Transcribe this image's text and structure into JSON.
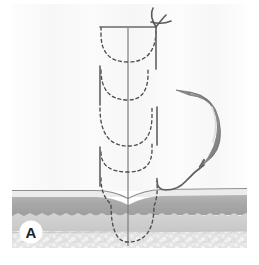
{
  "figure": {
    "panel_label": "A",
    "caption": "",
    "background_color": "#ffffff",
    "canvas": {
      "width": 259,
      "height": 265
    },
    "illustration_bounds": {
      "x": 12,
      "y": 4,
      "width": 235,
      "height": 244
    }
  },
  "tissue_layers": [
    {
      "name": "epidermis-surface-line",
      "label": "Epidermis surface",
      "color": "#8a8a8a",
      "top": 189,
      "height": 2
    },
    {
      "name": "epidermis-band",
      "label": "Epidermis",
      "color": "#e6e6e6",
      "top": 191,
      "height": 5
    },
    {
      "name": "dermis-band",
      "label": "Dermis",
      "color": "#a9a9a9",
      "top": 196,
      "height": 20
    },
    {
      "name": "subcutaneous-band",
      "label": "Subcutaneous layer",
      "color": "#cfcfcf",
      "top": 216,
      "height": 16
    },
    {
      "name": "fat-layer",
      "label": "Adipose / fat tissue",
      "color": "#dcdcdc",
      "top": 232,
      "height": 16
    },
    {
      "name": "upper-tissue-field",
      "label": "Tissue above skin (field)",
      "color": "#fafafa",
      "top": 4,
      "height": 185
    }
  ],
  "suture": {
    "name": "suture-thread",
    "color": "#6e6e6e",
    "dash_color": "#4d4d4d",
    "dash_pattern": "3 3",
    "stroke_width": 1.4,
    "loop_count": 4,
    "loops": [
      {
        "index": 1,
        "label": "subcuticular-bite-1",
        "depth_y": 56,
        "span_left_x": 100,
        "span_right_x": 156
      },
      {
        "index": 2,
        "label": "subcuticular-bite-2",
        "depth_y": 98,
        "span_left_x": 100,
        "span_right_x": 142
      },
      {
        "index": 3,
        "label": "subcuticular-bite-3",
        "depth_y": 143,
        "span_left_x": 100,
        "span_right_x": 152
      },
      {
        "index": 4,
        "label": "subcuticular-bite-4",
        "depth_y": 170,
        "span_left_x": 100,
        "span_right_x": 152
      },
      {
        "index": 5,
        "label": "deep-dermal-bite-bottom",
        "depth_y": 240,
        "span_left_x": 111,
        "span_right_x": 155
      }
    ]
  },
  "needle": {
    "name": "curved-surgical-needle",
    "label": "Curved surgical needle",
    "body_color": "#8c8c8c",
    "highlight_color": "#d9d9d9",
    "tip_x": 190,
    "tip_y": 92,
    "swage_x": 213,
    "swage_y": 155
  },
  "incision": {
    "name": "incision-line",
    "label": "Wound / incision line",
    "color": "#7d7d7d",
    "x": 128,
    "top_y": 28,
    "bottom_y": 246
  },
  "knot": {
    "name": "suture-knot-tails",
    "label": "Thread tails at wound apex",
    "color": "#5a5a5a",
    "x": 156,
    "y": 24
  }
}
